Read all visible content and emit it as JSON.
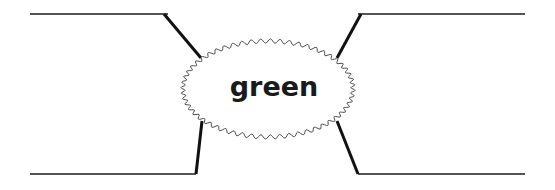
{
  "diagram": {
    "type": "feynman-like-scattering-diagram",
    "background_color": "#ffffff",
    "node": {
      "label": "green",
      "shape": "wavy-ellipse",
      "center_x": 268,
      "center_y": 89,
      "radius_x": 85,
      "radius_y": 48,
      "stroke_color": "#4a4a4a",
      "fill_color": "#ffffff",
      "text_color": "#1a1a1a"
    },
    "horizontal_lines": [
      {
        "name": "top-left-line",
        "x1": 30,
        "y1": 14,
        "x2": 168,
        "y2": 14,
        "color": "#555555",
        "width": 2
      },
      {
        "name": "top-right-line",
        "x1": 358,
        "y1": 14,
        "x2": 525,
        "y2": 14,
        "color": "#555555",
        "width": 2
      },
      {
        "name": "bottom-left-line",
        "x1": 30,
        "y1": 174,
        "x2": 196,
        "y2": 174,
        "color": "#555555",
        "width": 2
      },
      {
        "name": "bottom-right-line",
        "x1": 358,
        "y1": 174,
        "x2": 525,
        "y2": 174,
        "color": "#555555",
        "width": 2
      }
    ],
    "diagonal_lines": [
      {
        "name": "upper-left-diagonal",
        "x1": 164,
        "y1": 14,
        "x2": 201,
        "y2": 58,
        "color": "#111111",
        "width": 3
      },
      {
        "name": "upper-right-diagonal",
        "x1": 361,
        "y1": 14,
        "x2": 337,
        "y2": 58,
        "color": "#111111",
        "width": 3
      },
      {
        "name": "lower-left-diagonal",
        "x1": 196,
        "y1": 174,
        "x2": 202,
        "y2": 121,
        "color": "#111111",
        "width": 3
      },
      {
        "name": "lower-right-diagonal",
        "x1": 358,
        "y1": 174,
        "x2": 337,
        "y2": 121,
        "color": "#111111",
        "width": 3
      }
    ]
  }
}
